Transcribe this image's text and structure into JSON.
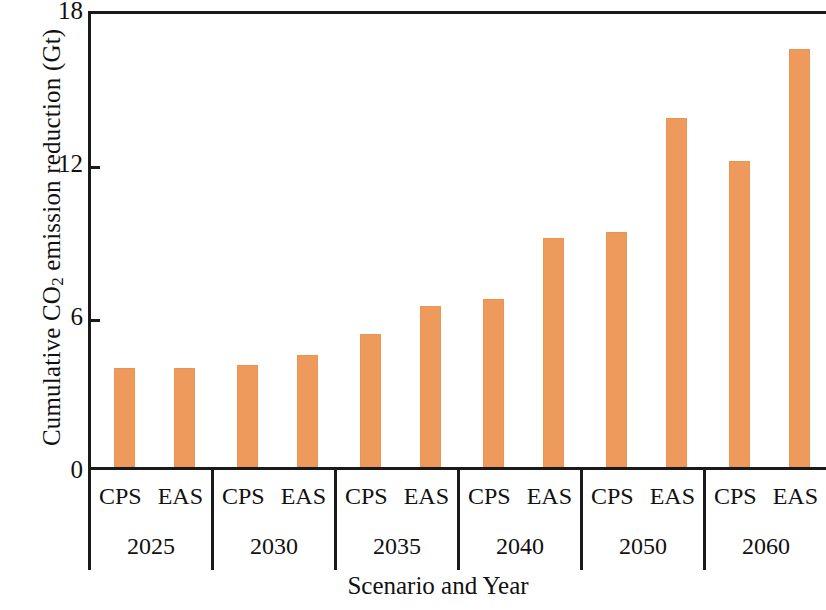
{
  "chart_data": {
    "type": "bar",
    "title": "",
    "xlabel": "Scenario and Year",
    "ylabel": "Cumulative CO2 emission reduction (Gt)",
    "ylabel_parts": {
      "pre": "Cumulative CO",
      "sub": "2",
      "post": " emission reduction (Gt)"
    },
    "ylim": [
      0,
      18
    ],
    "yticks": [
      0,
      6,
      12,
      18
    ],
    "ytick_labels": [
      "0",
      "6",
      "12",
      "18"
    ],
    "grid": false,
    "legend": "none",
    "bar_color": "#ef9a5d",
    "axis_color": "#1a1a1a",
    "categories": [
      "2025",
      "2030",
      "2035",
      "2040",
      "2050",
      "2060"
    ],
    "subcategories": [
      "CPS",
      "EAS"
    ],
    "series": [
      {
        "name": "CPS",
        "values": [
          3.9,
          4.0,
          5.2,
          6.6,
          9.2,
          12.0
        ]
      },
      {
        "name": "EAS",
        "values": [
          3.9,
          4.4,
          6.3,
          9.0,
          13.7,
          16.4
        ]
      }
    ],
    "groups": [
      {
        "year": "2025",
        "bars": [
          {
            "scenario": "CPS",
            "value": 3.9
          },
          {
            "scenario": "EAS",
            "value": 3.9
          }
        ]
      },
      {
        "year": "2030",
        "bars": [
          {
            "scenario": "CPS",
            "value": 4.0
          },
          {
            "scenario": "EAS",
            "value": 4.4
          }
        ]
      },
      {
        "year": "2035",
        "bars": [
          {
            "scenario": "CPS",
            "value": 5.2
          },
          {
            "scenario": "EAS",
            "value": 6.3
          }
        ]
      },
      {
        "year": "2040",
        "bars": [
          {
            "scenario": "CPS",
            "value": 6.6
          },
          {
            "scenario": "EAS",
            "value": 9.0
          }
        ]
      },
      {
        "year": "2050",
        "bars": [
          {
            "scenario": "CPS",
            "value": 9.2
          },
          {
            "scenario": "EAS",
            "value": 13.7
          }
        ]
      },
      {
        "year": "2060",
        "bars": [
          {
            "scenario": "CPS",
            "value": 12.0
          },
          {
            "scenario": "EAS",
            "value": 16.4
          }
        ]
      }
    ]
  }
}
